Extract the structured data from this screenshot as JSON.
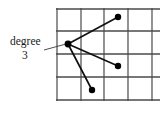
{
  "figure": {
    "caption_label": "degree",
    "caption_value": "3",
    "colors": {
      "grid_line": "#4a4a4a",
      "edge_line": "#111111",
      "vertex_fill": "#000000",
      "leader_line": "#3a3a3a",
      "background": "#ffffff",
      "text": "#1a1a1a"
    }
  },
  "chart_data": {
    "type": "scatter",
    "title": "",
    "subtitle": "",
    "xlabel": "",
    "ylabel": "",
    "grid": true,
    "legend_position": "none",
    "xlim": [
      0,
      4
    ],
    "ylim": [
      0,
      4
    ],
    "grid_columns": 4,
    "grid_rows": 4,
    "grid_x_pixels": [
      57,
      81,
      104,
      128,
      152
    ],
    "grid_y_pixels": [
      9,
      31,
      54,
      77,
      100
    ],
    "grid_right_extent_pixels": 160,
    "annotations": [
      {
        "text": "degree",
        "x_pixel": 10,
        "y_pixel": 45,
        "points_to_vertex": "center"
      },
      {
        "text": "3",
        "x_pixel": 22,
        "y_pixel": 59,
        "points_to_vertex": "center"
      }
    ],
    "leader_line": {
      "from_pixel": [
        44,
        50
      ],
      "to_pixel": [
        66,
        44
      ]
    },
    "vertices": [
      {
        "name": "center",
        "x_pixel": 68,
        "y_pixel": 44,
        "degree": 3,
        "radius": 3.4
      },
      {
        "name": "upper-right",
        "x_pixel": 118,
        "y_pixel": 17,
        "degree": 1,
        "radius": 3.2
      },
      {
        "name": "middle-right",
        "x_pixel": 118,
        "y_pixel": 66,
        "degree": 1,
        "radius": 3.2
      },
      {
        "name": "lower-middle",
        "x_pixel": 92,
        "y_pixel": 90,
        "degree": 1,
        "radius": 3.2
      }
    ],
    "edges": [
      {
        "from": "center",
        "to": "upper-right"
      },
      {
        "from": "center",
        "to": "middle-right"
      },
      {
        "from": "center",
        "to": "lower-middle"
      }
    ]
  }
}
